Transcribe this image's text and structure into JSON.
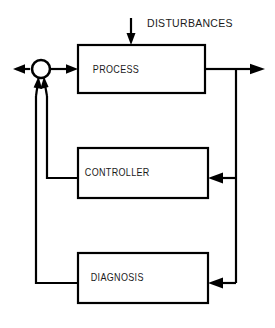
{
  "diagram": {
    "type": "block-diagram",
    "background_color": "#ffffff",
    "line_color": "#000000",
    "text_color": "#1a1a1a",
    "blocks": [
      {
        "id": "process",
        "label": "PROCESS",
        "x": 78,
        "y": 45,
        "width": 127,
        "height": 48,
        "center_x": 141.5,
        "center_y": 69
      },
      {
        "id": "controller",
        "label": "CONTROLLER",
        "x": 78,
        "y": 148,
        "width": 130,
        "height": 50,
        "center_x": 143,
        "center_y": 173
      },
      {
        "id": "diagnosis",
        "label": "DIAGNOSIS",
        "x": 78,
        "y": 253,
        "width": 130,
        "height": 50,
        "center_x": 143,
        "center_y": 278
      }
    ],
    "junction": {
      "id": "summing-junction",
      "center_x": 41,
      "center_y": 69,
      "radius": 9,
      "input_count": 2,
      "input_sources": [
        "controller",
        "diagnosis"
      ]
    },
    "signals": [
      {
        "id": "disturbances",
        "label": "DISTURBANCES",
        "label_x": 140,
        "label_y": 24,
        "direction": "down",
        "target": "process"
      }
    ],
    "connections": [
      {
        "id": "junction-to-process",
        "from": "summing-junction",
        "to": "process",
        "direction": "right"
      },
      {
        "id": "junction-output-left",
        "from": "summing-junction",
        "to": "external-left",
        "direction": "left"
      },
      {
        "id": "process-output-right",
        "from": "process",
        "to": "external-right",
        "direction": "right"
      },
      {
        "id": "process-to-controller",
        "from": "process",
        "to": "controller",
        "direction": "left"
      },
      {
        "id": "process-to-diagnosis",
        "from": "process",
        "to": "diagnosis",
        "direction": "left"
      },
      {
        "id": "controller-to-junction",
        "from": "controller",
        "to": "summing-junction",
        "direction": "up"
      },
      {
        "id": "diagnosis-to-junction",
        "from": "diagnosis",
        "to": "summing-junction",
        "direction": "up"
      }
    ]
  }
}
